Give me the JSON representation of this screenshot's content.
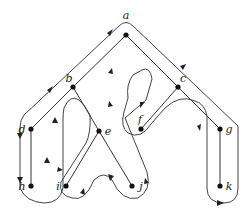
{
  "diagram": {
    "type": "tree-traversal",
    "nodes": [
      {
        "id": "a",
        "label": "a",
        "x": 126,
        "y": 35,
        "lx": 126,
        "ly": 19
      },
      {
        "id": "b",
        "label": "b",
        "x": 73,
        "y": 87,
        "lx": 69,
        "ly": 82
      },
      {
        "id": "c",
        "label": "c",
        "x": 178,
        "y": 87,
        "lx": 183,
        "ly": 82
      },
      {
        "id": "d",
        "label": "d",
        "x": 31,
        "y": 129,
        "lx": 22,
        "ly": 133
      },
      {
        "id": "e",
        "label": "e",
        "x": 99,
        "y": 131,
        "lx": 108,
        "ly": 135
      },
      {
        "id": "f",
        "label": "f",
        "x": 141,
        "y": 129,
        "lx": 140,
        "ly": 123
      },
      {
        "id": "g",
        "label": "g",
        "x": 220,
        "y": 129,
        "lx": 229,
        "ly": 133
      },
      {
        "id": "h",
        "label": "h",
        "x": 31,
        "y": 186,
        "lx": 22,
        "ly": 190
      },
      {
        "id": "i",
        "label": "i",
        "x": 66,
        "y": 186,
        "lx": 58,
        "ly": 190
      },
      {
        "id": "j",
        "label": "j",
        "x": 132,
        "y": 186,
        "lx": 141,
        "ly": 190
      },
      {
        "id": "k",
        "label": "k",
        "x": 220,
        "y": 186,
        "lx": 229,
        "ly": 190
      }
    ],
    "edges": [
      [
        "a",
        "b"
      ],
      [
        "a",
        "c"
      ],
      [
        "b",
        "d"
      ],
      [
        "b",
        "e"
      ],
      [
        "d",
        "h"
      ],
      [
        "e",
        "i"
      ],
      [
        "e",
        "j"
      ],
      [
        "c",
        "f"
      ],
      [
        "c",
        "g"
      ],
      [
        "g",
        "k"
      ]
    ],
    "traversal": "counterclockwise walk around the tree starting at root a"
  }
}
